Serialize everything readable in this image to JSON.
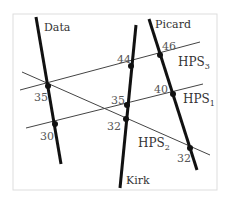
{
  "figure": {
    "frame": {
      "x": 13,
      "y": 14,
      "w": 204,
      "h": 176,
      "stroke": "#dddddd"
    },
    "colors": {
      "thick_line": "#111111",
      "thin_line": "#444444",
      "dot": "#111111",
      "text": "#333333",
      "number": "#555555"
    },
    "people": [
      {
        "name": "Data",
        "x1": 36,
        "y1": 17,
        "x2": 61,
        "y2": 164,
        "label_x": 44,
        "label_y": 31
      },
      {
        "name": "Kirk",
        "x1": 136,
        "y1": 25,
        "x2": 120,
        "y2": 188,
        "label_x": 126,
        "label_y": 184
      },
      {
        "name": "Picard",
        "x1": 149,
        "y1": 19,
        "x2": 197,
        "y2": 170,
        "label_x": 155,
        "label_y": 28
      }
    ],
    "hps_lines": [
      {
        "name": "HPS",
        "sub": "3",
        "x1": 20,
        "y1": 90,
        "x2": 200,
        "y2": 42,
        "label_x": 178,
        "label_y": 66
      },
      {
        "name": "HPS",
        "sub": "1",
        "x1": 26,
        "y1": 128,
        "x2": 203,
        "y2": 84,
        "label_x": 183,
        "label_y": 103
      },
      {
        "name": "HPS",
        "sub": "2",
        "x1": 22,
        "y1": 72,
        "x2": 210,
        "y2": 155,
        "label_x": 138,
        "label_y": 147
      }
    ],
    "intersections": [
      {
        "person": "Data",
        "hps": "HPS3/HPS2",
        "value": "35",
        "x": 48,
        "y": 86,
        "label_x": 34,
        "label_y": 101
      },
      {
        "person": "Data",
        "hps": "HPS1",
        "value": "30",
        "x": 55,
        "y": 124,
        "label_x": 40,
        "label_y": 140
      },
      {
        "person": "Kirk",
        "hps": "HPS3",
        "value": "44",
        "x": 131,
        "y": 66,
        "label_x": 117,
        "label_y": 63
      },
      {
        "person": "Kirk",
        "hps": "HPS1",
        "value": "35",
        "x": 127,
        "y": 105,
        "label_x": 111,
        "label_y": 104
      },
      {
        "person": "Kirk",
        "hps": "HPS2",
        "value": "32",
        "x": 126,
        "y": 119,
        "label_x": 107,
        "label_y": 130
      },
      {
        "person": "Picard",
        "hps": "HPS3",
        "value": "46",
        "x": 160,
        "y": 55,
        "label_x": 162,
        "label_y": 50
      },
      {
        "person": "Picard",
        "hps": "HPS1",
        "value": "40",
        "x": 173,
        "y": 94,
        "label_x": 154,
        "label_y": 93
      },
      {
        "person": "Picard",
        "hps": "HPS2",
        "value": "32",
        "x": 190,
        "y": 148,
        "label_x": 177,
        "label_y": 162
      }
    ]
  }
}
